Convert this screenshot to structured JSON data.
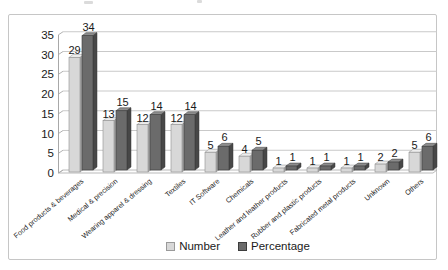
{
  "chart_data": {
    "type": "bar",
    "style": "3d-clustered-column",
    "title": "",
    "xlabel": "",
    "ylabel": "",
    "categories": [
      "Food products & beverages",
      "Medical & precision",
      "Wearing apparel & dressing",
      "Textiles",
      "IT Software",
      "Chemicals",
      "Leather and leather products",
      "Rubber and plastic products",
      "Fabricated metal products",
      "Unknown",
      "Others"
    ],
    "series": [
      {
        "name": "Number",
        "values": [
          29,
          13,
          12,
          12,
          5,
          4,
          1,
          1,
          1,
          2,
          5
        ],
        "color": "#d8d8d8",
        "top_color": "#ededed",
        "side_color": "#ababab",
        "edge_color": "#8f8f8f"
      },
      {
        "name": "Percentage",
        "values": [
          34,
          15,
          14,
          14,
          6,
          5,
          1,
          1,
          1,
          2,
          6
        ],
        "color": "#6b6b6b",
        "top_color": "#8d8d8d",
        "side_color": "#474747",
        "edge_color": "#3a3a3a"
      }
    ],
    "ylim": [
      0,
      35
    ],
    "ytick_step": 5,
    "yticks": [
      0,
      5,
      10,
      15,
      20,
      25,
      30,
      35
    ],
    "grid": true,
    "data_labels": true,
    "legend_position": "bottom-center",
    "colors": {
      "gridline": "#c9c9c9",
      "axis": "#a8a8a8",
      "text": "#1a1a1a",
      "frame_border": "#c6c6c6",
      "background": "#ffffff"
    }
  },
  "legend": {
    "items": [
      {
        "label": "Number",
        "swatch": "#d8d8d8",
        "swatch_border": "#9a9a9a"
      },
      {
        "label": "Percentage",
        "swatch": "#6b6b6b",
        "swatch_border": "#3d3d3d"
      }
    ]
  }
}
